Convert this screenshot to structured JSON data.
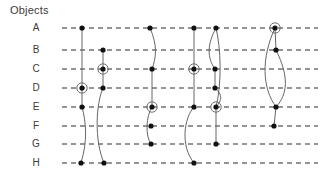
{
  "title": "Objects",
  "colors": {
    "grid": "#2b2b2b",
    "track": "#666666",
    "node": "#111111",
    "halo": "#6e6e6e",
    "text": "#3b3b3b",
    "background": "#ffffff"
  },
  "chart_data": {
    "type": "storyline",
    "title": "Objects",
    "xlabel": "",
    "ylabel": "Objects",
    "grid": true,
    "legend": false,
    "row_labels": [
      "A",
      "B",
      "C",
      "D",
      "E",
      "F",
      "G",
      "H"
    ],
    "row_y": [
      28,
      50,
      69,
      88,
      107,
      126,
      144,
      163
    ],
    "label_x": 36,
    "grid_x_start": 62,
    "grid_x_end": 318,
    "node_radius": 2.6,
    "halo_radius": 5.2,
    "tracks": [
      {
        "id": "track-1",
        "points": [
          {
            "row": "A",
            "x": 82,
            "highlight": false
          },
          {
            "row": "D",
            "x": 82,
            "highlight": true
          },
          {
            "row": "E",
            "x": 82,
            "highlight": false
          },
          {
            "row": "H",
            "x": 81,
            "highlight": false
          }
        ],
        "path": "M 82 28 L 82 88 L 82 107 C 86 122 88 140 81 163"
      },
      {
        "id": "track-2",
        "points": [
          {
            "row": "B",
            "x": 103,
            "highlight": false
          },
          {
            "row": "C",
            "x": 103,
            "highlight": true
          },
          {
            "row": "D",
            "x": 103,
            "highlight": false
          },
          {
            "row": "H",
            "x": 104,
            "highlight": false
          }
        ],
        "path": "M 103 50 L 103 69 L 103 88 C 96 104 94 140 104 163"
      },
      {
        "id": "track-3",
        "points": [
          {
            "row": "A",
            "x": 150,
            "highlight": false
          },
          {
            "row": "C",
            "x": 152,
            "highlight": false
          },
          {
            "row": "E",
            "x": 152,
            "highlight": true
          },
          {
            "row": "F",
            "x": 151,
            "highlight": false
          },
          {
            "row": "G",
            "x": 151,
            "highlight": false
          }
        ],
        "path": "M 150 28 C 158 46 156 58 152 69 L 152 107 C 146 116 145 136 151 144"
      },
      {
        "id": "track-4",
        "points": [
          {
            "row": "A",
            "x": 194,
            "highlight": false
          },
          {
            "row": "C",
            "x": 194,
            "highlight": true
          },
          {
            "row": "E",
            "x": 194,
            "highlight": false
          },
          {
            "row": "H",
            "x": 194,
            "highlight": false
          }
        ],
        "path": "M 194 28 L 194 69 L 194 107 C 184 118 180 146 194 163"
      },
      {
        "id": "track-5",
        "points": [
          {
            "row": "A",
            "x": 216,
            "highlight": false
          },
          {
            "row": "C",
            "x": 215,
            "highlight": false
          },
          {
            "row": "D",
            "x": 215,
            "highlight": false
          },
          {
            "row": "E",
            "x": 216,
            "highlight": true
          },
          {
            "row": "G",
            "x": 216,
            "highlight": false
          }
        ],
        "path": "M 216 28 C 207 44 207 58 215 69 L 215 88 C 223 95 222 100 216 107 L 216 144"
      },
      {
        "id": "track-5-loop",
        "points": [],
        "path": "M 216 28 C 221 48 222 84 216 107"
      },
      {
        "id": "track-6",
        "points": [
          {
            "row": "A",
            "x": 275,
            "highlight": true
          },
          {
            "row": "B",
            "x": 276,
            "highlight": false
          },
          {
            "row": "E",
            "x": 276,
            "highlight": false
          },
          {
            "row": "F",
            "x": 274,
            "highlight": false
          }
        ],
        "path": "M 275 28 L 276 50 C 289 76 288 94 276 107 L 274 126"
      },
      {
        "id": "track-6-loop",
        "points": [],
        "path": "M 275 28 C 261 58 262 88 276 107"
      }
    ]
  }
}
